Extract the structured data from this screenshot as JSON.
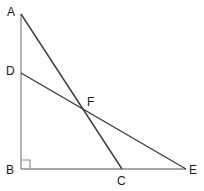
{
  "figure": {
    "background_color": "#ffffff",
    "width": 204,
    "height": 191,
    "leg_color": "#8a8a8a",
    "diagonal_color": "#3a3a3a",
    "label_color": "#1a1a1a",
    "right_angle_marker_color": "#8a8a8a"
  },
  "points": [
    {
      "id": "A",
      "label": "A",
      "x": 21,
      "y": 14,
      "label_x": 7,
      "label_y": 6
    },
    {
      "id": "B",
      "label": "B",
      "x": 21,
      "y": 169,
      "label_x": 6,
      "label_y": 164
    },
    {
      "id": "C",
      "label": "C",
      "x": 122,
      "y": 169,
      "label_x": 117,
      "label_y": 175
    },
    {
      "id": "D",
      "label": "D",
      "x": 21,
      "y": 73,
      "label_x": 6,
      "label_y": 65
    },
    {
      "id": "E",
      "label": "E",
      "x": 186,
      "y": 169,
      "label_x": 189,
      "label_y": 164
    },
    {
      "id": "F",
      "label": "F",
      "x": 85,
      "y": 110,
      "label_x": 87,
      "label_y": 96
    }
  ],
  "segments": [
    {
      "id": "AB",
      "from": "A",
      "to": "B",
      "x1": 21,
      "y1": 14,
      "x2": 21,
      "y2": 169,
      "color": "#8a8a8a",
      "width": 1.3
    },
    {
      "id": "BE",
      "from": "B",
      "to": "E",
      "x1": 21,
      "y1": 169,
      "x2": 186,
      "y2": 169,
      "color": "#8a8a8a",
      "width": 1.3
    },
    {
      "id": "AC",
      "from": "A",
      "to": "C",
      "x1": 21,
      "y1": 14,
      "x2": 122,
      "y2": 169,
      "color": "#3a3a3a",
      "width": 1.4
    },
    {
      "id": "DE",
      "from": "D",
      "to": "E",
      "x1": 21,
      "y1": 73,
      "x2": 186,
      "y2": 169,
      "color": "#3a3a3a",
      "width": 1.4
    }
  ],
  "right_angle": {
    "at": "B",
    "x": 22,
    "y": 160,
    "size": 8,
    "color": "#8a8a8a"
  }
}
